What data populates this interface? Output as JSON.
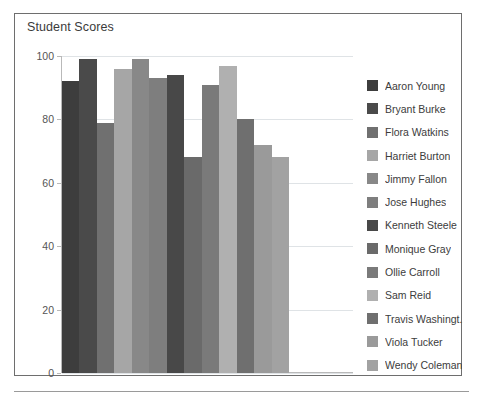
{
  "chart": {
    "title": "Student Scores"
  },
  "chart_data": {
    "type": "bar",
    "title": "Student Scores",
    "xlabel": "",
    "ylabel": "",
    "ylim": [
      0,
      100
    ],
    "yticks": [
      0,
      20,
      40,
      60,
      80,
      100
    ],
    "ytick_labels": [
      "0",
      "20",
      "40",
      "60",
      "80",
      "100"
    ],
    "grid": true,
    "legend_position": "right",
    "categories": [
      "Aaron Young",
      "Bryant Burke",
      "Flora Watkins",
      "Harriet Burton",
      "Jimmy Fallon",
      "Jose Hughes",
      "Kenneth Steele",
      "Monique Gray",
      "Ollie Carroll",
      "Sam Reid",
      "Travis Washingt...",
      "Viola Tucker",
      "Wendy Coleman"
    ],
    "values": [
      92,
      99,
      79,
      96,
      99,
      93,
      94,
      68,
      91,
      97,
      80,
      72,
      68
    ],
    "colors": [
      "#3d3d3d",
      "#4a4a4a",
      "#707070",
      "#a6a6a6",
      "#888888",
      "#7e7e7e",
      "#484848",
      "#6a6a6a",
      "#7a7a7a",
      "#b0b0b0",
      "#6f6f6f",
      "#9a9a9a",
      "#a2a2a2"
    ]
  },
  "legend": {
    "items": [
      {
        "label": "Aaron Young",
        "color": "#3d3d3d"
      },
      {
        "label": "Bryant Burke",
        "color": "#4a4a4a"
      },
      {
        "label": "Flora Watkins",
        "color": "#707070"
      },
      {
        "label": "Harriet Burton",
        "color": "#a6a6a6"
      },
      {
        "label": "Jimmy Fallon",
        "color": "#888888"
      },
      {
        "label": "Jose Hughes",
        "color": "#7e7e7e"
      },
      {
        "label": "Kenneth Steele",
        "color": "#484848"
      },
      {
        "label": "Monique Gray",
        "color": "#6a6a6a"
      },
      {
        "label": "Ollie Carroll",
        "color": "#7a7a7a"
      },
      {
        "label": "Sam Reid",
        "color": "#b0b0b0"
      },
      {
        "label": "Travis Washingt...",
        "color": "#6f6f6f"
      },
      {
        "label": "Viola Tucker",
        "color": "#9a9a9a"
      },
      {
        "label": "Wendy Coleman",
        "color": "#a2a2a2"
      }
    ]
  }
}
